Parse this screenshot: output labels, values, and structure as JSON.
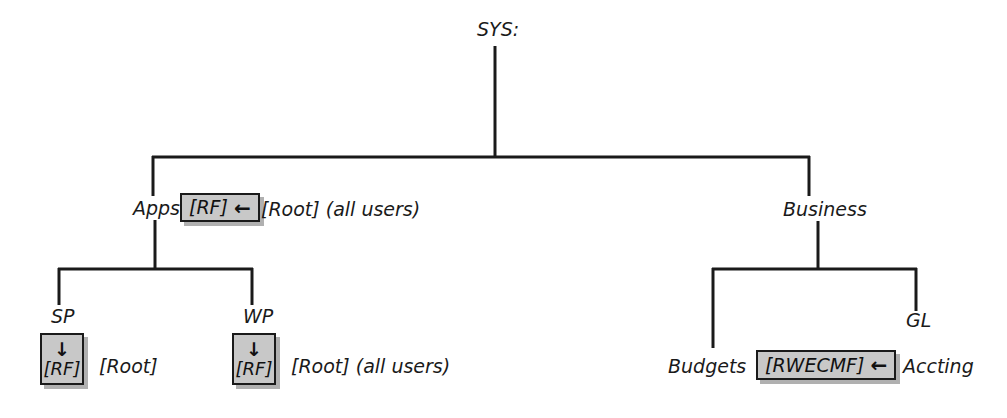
{
  "diagram": {
    "type": "tree",
    "background_color": "#ffffff",
    "line_color": "#1a1a1a",
    "box_fill_color": "#c8c8c8",
    "box_border_color": "#1a1a1a"
  },
  "nodes": {
    "root": {
      "label": "SYS:"
    },
    "apps": {
      "label": "Apps"
    },
    "business": {
      "label": "Business"
    },
    "sp": {
      "label": "SP"
    },
    "wp": {
      "label": "WP"
    },
    "budgets": {
      "label": "Budgets"
    },
    "gl": {
      "label": "GL"
    }
  },
  "rights_boxes": {
    "apps_irf": {
      "rights": "[RF]",
      "arrow": "←",
      "orientation": "horizontal",
      "arrow_direction": "left"
    },
    "sp_irf": {
      "rights": "[RF]",
      "arrow": "↓",
      "orientation": "vertical",
      "arrow_direction": "down"
    },
    "wp_irf": {
      "rights": "[RF]",
      "arrow": "↓",
      "orientation": "vertical",
      "arrow_direction": "down"
    },
    "budgets_irf": {
      "rights": "[RWECMF]",
      "arrow": "←",
      "orientation": "horizontal",
      "arrow_direction": "left"
    }
  },
  "annotations": {
    "apps_trustee": "[Root] (all users)",
    "sp_trustee": "[Root]",
    "wp_trustee": "[Root] (all users)",
    "accting_trustee": "Accting"
  }
}
